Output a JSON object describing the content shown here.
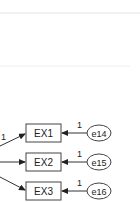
{
  "diagram": {
    "type": "path-diagram",
    "observed": [
      {
        "label": "EX1",
        "error": "e14",
        "error_weight": "1",
        "loading": "1"
      },
      {
        "label": "EX2",
        "error": "e15",
        "error_weight": "1",
        "loading": ""
      },
      {
        "label": "EX3",
        "error": "e16",
        "error_weight": "1",
        "loading": ""
      }
    ],
    "colors": {
      "stroke": "#333333",
      "fill": "#ffffff",
      "text": "#222222"
    }
  }
}
